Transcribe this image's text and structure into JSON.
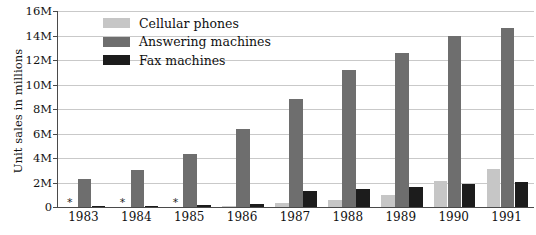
{
  "chart_data": {
    "type": "bar",
    "title": "",
    "xlabel": "",
    "ylabel": "Unit sales in millions",
    "categories": [
      "1983",
      "1984",
      "1985",
      "1986",
      "1987",
      "1988",
      "1989",
      "1990",
      "1991"
    ],
    "series": [
      {
        "name": "Cellular phones",
        "color": "#c6c6c6",
        "values": [
          0,
          0,
          0,
          0.1,
          0.35,
          0.6,
          1.0,
          2.1,
          3.1
        ],
        "markers": [
          "*",
          "*",
          "*",
          "",
          "",
          "",
          "",
          "",
          ""
        ]
      },
      {
        "name": "Answering machines",
        "color": "#6e6e6e",
        "values": [
          2.25,
          3.05,
          4.3,
          6.4,
          8.8,
          11.2,
          12.6,
          14.0,
          14.6
        ],
        "markers": [
          "",
          "",
          "",
          "",
          "",
          "",
          "",
          "",
          ""
        ]
      },
      {
        "name": "Fax machines",
        "color": "#1c1c1c",
        "values": [
          0.06,
          0.1,
          0.15,
          0.25,
          1.3,
          1.5,
          1.6,
          1.85,
          2.05
        ],
        "markers": [
          "",
          "",
          "",
          "",
          "",
          "",
          "",
          "",
          ""
        ]
      }
    ],
    "ylim": [
      0,
      16
    ],
    "yticks": [
      0,
      2,
      4,
      6,
      8,
      10,
      12,
      14,
      16
    ],
    "ytick_labels": [
      "0",
      "2M",
      "4M",
      "6M",
      "8M",
      "10M",
      "12M",
      "14M",
      "16M"
    ],
    "grid": "horizontal",
    "legend_position": "top-left",
    "footnote_marker": "*",
    "axis_color": "#4a4a4a",
    "grid_color": "#c9c9c9",
    "background": "#ffffff"
  }
}
